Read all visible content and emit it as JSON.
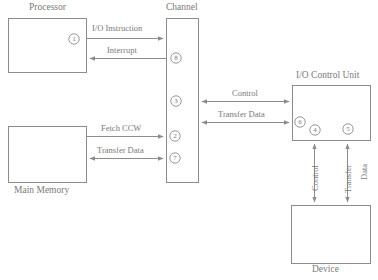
{
  "diagram": {
    "stroke_color": "#8c8c8c",
    "text_color": "#7a7a7a",
    "background_color": "#ffffff",
    "boxes": [
      {
        "id": "processor",
        "label": "Processor",
        "label_position": "top",
        "x": 8,
        "y": 18,
        "w": 78,
        "h": 54
      },
      {
        "id": "main-memory",
        "label": "Main Memory",
        "label_position": "bottom",
        "x": 8,
        "y": 126,
        "w": 78,
        "h": 56
      },
      {
        "id": "channel",
        "label": "Channel",
        "label_position": "top",
        "x": 166,
        "y": 18,
        "w": 32,
        "h": 164
      },
      {
        "id": "io-control-unit",
        "label": "I/O Control Unit",
        "label_position": "top",
        "x": 292,
        "y": 85,
        "w": 78,
        "h": 55
      },
      {
        "id": "device",
        "label": "Device",
        "label_position": "bottom",
        "x": 291,
        "y": 205,
        "w": 79,
        "h": 58
      }
    ],
    "connections": [
      {
        "id": "io-instruction",
        "label": "I/O Instruction",
        "direction": "right",
        "orientation": "horizontal",
        "from": "processor",
        "to": "channel"
      },
      {
        "id": "interrupt",
        "label": "Interrupt",
        "direction": "left",
        "orientation": "horizontal",
        "from": "channel",
        "to": "processor"
      },
      {
        "id": "fetch-ccw",
        "label": "Fetch CCW",
        "direction": "right",
        "orientation": "horizontal",
        "from": "main-memory",
        "to": "channel"
      },
      {
        "id": "memory-transfer-data",
        "label": "Transfer Data",
        "direction": "both",
        "orientation": "horizontal",
        "from": "main-memory",
        "to": "channel"
      },
      {
        "id": "control",
        "label": "Control",
        "direction": "both",
        "orientation": "horizontal",
        "from": "channel",
        "to": "io-control-unit"
      },
      {
        "id": "channel-transfer-data",
        "label": "Transfer Data",
        "direction": "both",
        "orientation": "horizontal",
        "from": "channel",
        "to": "io-control-unit"
      },
      {
        "id": "device-control",
        "label": "Control",
        "direction": "both",
        "orientation": "vertical",
        "from": "io-control-unit",
        "to": "device"
      },
      {
        "id": "device-transfer",
        "label": "Transfer",
        "direction": "both",
        "orientation": "vertical",
        "from": "io-control-unit",
        "to": "device"
      },
      {
        "id": "device-data",
        "label": "Data",
        "direction": "none",
        "orientation": "vertical",
        "from": "io-control-unit",
        "to": "device"
      }
    ],
    "step_markers": [
      {
        "id": "step-1",
        "value": "1",
        "cx": 74,
        "cy": 39,
        "located_in": "processor"
      },
      {
        "id": "step-8",
        "value": "8",
        "cx": 176,
        "cy": 58,
        "located_in": "channel"
      },
      {
        "id": "step-3",
        "value": "3",
        "cx": 176,
        "cy": 101,
        "located_in": "channel"
      },
      {
        "id": "step-2",
        "value": "2",
        "cx": 175,
        "cy": 136,
        "located_in": "channel"
      },
      {
        "id": "step-7",
        "value": "7",
        "cx": 175,
        "cy": 158,
        "located_in": "channel"
      },
      {
        "id": "step-6",
        "value": "6",
        "cx": 300,
        "cy": 122,
        "located_in": "io-control-unit"
      },
      {
        "id": "step-4",
        "value": "4",
        "cx": 315,
        "cy": 130,
        "located_in": "io-control-unit"
      },
      {
        "id": "step-5",
        "value": "5",
        "cx": 348,
        "cy": 129,
        "located_in": "io-control-unit"
      }
    ]
  }
}
